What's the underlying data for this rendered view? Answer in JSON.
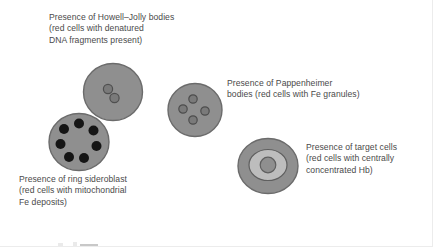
{
  "figure": {
    "background_color": "#ffffff",
    "width": 433,
    "height": 247
  },
  "palette": {
    "cell_body": "#8f8f8f",
    "cell_outline": "#6e6e6e",
    "inclusion_gray": "#7a7a7a",
    "inclusion_outline": "#555555",
    "inclusion_black": "#141414",
    "target_mid_ring": "#b8b8b8",
    "text_color": "#4a4a4a"
  },
  "captions": [
    {
      "id": "howell-jolly",
      "text": "Presence of Howell–Jolly bodies\n(red cells with denatured\nDNA fragments present)"
    },
    {
      "id": "pappenheimer",
      "text": "Presence of Pappenheimer\nbodies (red cells with Fe granules)"
    },
    {
      "id": "ring-sideroblast",
      "text": "Presence of ring sideroblast\n(red cells with mitochondrial\nFe deposits)"
    },
    {
      "id": "target-cells",
      "text": "Presence of target cells\n(red cells with centrally\nconcentrated Hb)"
    }
  ],
  "cells": [
    {
      "id": "howell-jolly-cell",
      "label": "Howell–Jolly body cell",
      "inclusion_count": 2,
      "inclusion_type": "denatured DNA fragment"
    },
    {
      "id": "pappenheimer-cell",
      "label": "Pappenheimer body cell",
      "inclusion_count": 4,
      "inclusion_type": "Fe granule"
    },
    {
      "id": "ring-sideroblast-cell",
      "label": "Ring sideroblast",
      "inclusion_count": 7,
      "inclusion_type": "mitochondrial Fe deposit"
    },
    {
      "id": "target-cell",
      "label": "Target cell",
      "inclusion_count": 1,
      "inclusion_type": "centrally concentrated Hb"
    }
  ]
}
